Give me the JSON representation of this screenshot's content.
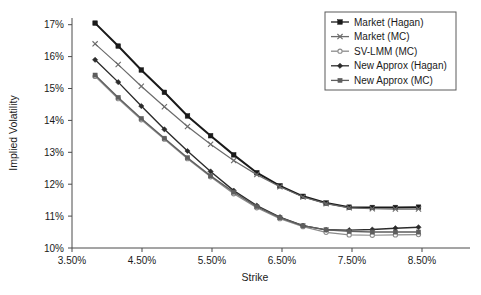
{
  "chart_data": {
    "type": "line",
    "title": "",
    "xlabel": "Strike",
    "ylabel": "Implied Volatility",
    "xlim": [
      3.5,
      8.5
    ],
    "ylim": [
      10,
      17
    ],
    "grid": false,
    "legend_position": "top-right",
    "x_tick_labels": [
      "3.50%",
      "4.50%",
      "5.50%",
      "6.50%",
      "7.50%",
      "8.50%"
    ],
    "x_tick_values": [
      3.5,
      4.5,
      5.5,
      6.5,
      7.5,
      8.5
    ],
    "y_tick_labels": [
      "10%",
      "11%",
      "12%",
      "13%",
      "14%",
      "15%",
      "16%",
      "17%"
    ],
    "y_tick_values": [
      10,
      11,
      12,
      13,
      14,
      15,
      16,
      17
    ],
    "x": [
      3.83,
      4.16,
      4.49,
      4.82,
      5.15,
      5.48,
      5.81,
      6.14,
      6.47,
      6.8,
      7.13,
      7.46,
      7.79,
      8.12,
      8.45
    ],
    "series": [
      {
        "name": "Market (Hagan)",
        "marker": "filled-square",
        "color": "#1a1a1a",
        "width": 2.0,
        "values": [
          17.05,
          16.33,
          15.58,
          14.88,
          14.14,
          13.52,
          12.92,
          12.36,
          11.95,
          11.62,
          11.41,
          11.28,
          11.27,
          11.27,
          11.28
        ]
      },
      {
        "name": "Market (MC)",
        "marker": "x",
        "color": "#6b6b6b",
        "width": 1.2,
        "values": [
          16.4,
          15.75,
          15.07,
          14.43,
          13.81,
          13.25,
          12.74,
          12.3,
          11.92,
          11.6,
          11.39,
          11.26,
          11.23,
          11.22,
          11.22
        ]
      },
      {
        "name": "SV-LMM (MC)",
        "marker": "open-circle",
        "color": "#8c8c8c",
        "width": 1.2,
        "values": [
          15.38,
          14.68,
          14.02,
          13.41,
          12.8,
          12.23,
          11.7,
          11.26,
          10.92,
          10.67,
          10.49,
          10.41,
          10.4,
          10.41,
          10.42
        ]
      },
      {
        "name": "New Approx (Hagan)",
        "marker": "filled-diamond",
        "color": "#2b2b2b",
        "width": 1.4,
        "values": [
          15.9,
          15.2,
          14.45,
          13.72,
          13.04,
          12.4,
          11.8,
          11.33,
          10.97,
          10.7,
          10.57,
          10.56,
          10.58,
          10.62,
          10.65
        ]
      },
      {
        "name": "New Approx (MC)",
        "marker": "filled-square-small",
        "color": "#5e5e5e",
        "width": 1.4,
        "values": [
          15.42,
          14.72,
          14.06,
          13.44,
          12.83,
          12.26,
          11.75,
          11.3,
          10.95,
          10.7,
          10.57,
          10.52,
          10.5,
          10.5,
          10.5
        ]
      }
    ]
  }
}
